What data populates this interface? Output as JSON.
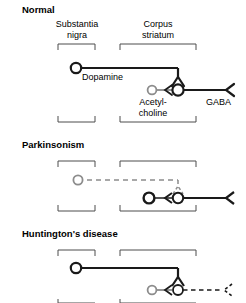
{
  "figure": {
    "type": "diagram",
    "panels": [
      {
        "title": "Normal",
        "regions": [
          {
            "name": "Substantia nigra",
            "line1": "Substantia",
            "line2": "nigra"
          },
          {
            "name": "Corpus striatum",
            "line1": "Corpus",
            "line2": "striatum"
          }
        ],
        "neurons": [
          {
            "label": "Dopamine",
            "state": "intact",
            "style": "solid-dark"
          },
          {
            "label_line1": "Acetyl-",
            "label_line2": "choline",
            "state": "normal",
            "style": "solid-gray"
          },
          {
            "label": "GABA",
            "state": "intact",
            "style": "solid-dark"
          }
        ]
      },
      {
        "title": "Parkinsonism",
        "regions": [
          {
            "name": "Substantia nigra"
          },
          {
            "name": "Corpus striatum"
          }
        ],
        "neurons": [
          {
            "label": "Dopamine",
            "state": "degenerated",
            "style": "dashed-gray"
          },
          {
            "label": "Acetylcholine",
            "state": "overactive",
            "style": "solid-dark"
          },
          {
            "label": "GABA",
            "state": "intact",
            "style": "solid-dark"
          }
        ]
      },
      {
        "title": "Huntington's disease",
        "regions": [
          {
            "name": "Substantia nigra"
          },
          {
            "name": "Corpus striatum"
          }
        ],
        "neurons": [
          {
            "label": "Dopamine",
            "state": "intact",
            "style": "solid-dark"
          },
          {
            "label": "Acetylcholine",
            "state": "normal",
            "style": "solid-gray"
          },
          {
            "label": "GABA",
            "state": "degenerated",
            "style": "dashed-dark"
          }
        ]
      }
    ],
    "labels": {
      "normal_title": "Normal",
      "parkinsonism_title": "Parkinsonism",
      "huntingtons_title": "Huntington's disease",
      "substantia_line1": "Substantia",
      "substantia_line2": "nigra",
      "corpus_line1": "Corpus",
      "corpus_line2": "striatum",
      "dopamine": "Dopamine",
      "acetyl_line1": "Acetyl-",
      "acetyl_line2": "choline",
      "gaba": "GABA"
    },
    "colors": {
      "ink": "#1a1a1a",
      "gray": "#8c8c8c",
      "bracket": "#4d4d4d",
      "background": "#ffffff"
    }
  }
}
